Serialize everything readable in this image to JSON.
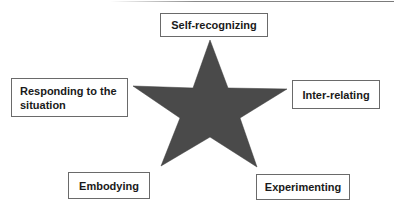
{
  "diagram": {
    "type": "star-with-labels",
    "center_shape": {
      "shape": "five-point-star",
      "fill_color": "#4a4a4a",
      "points": [
        [
          210,
          40
        ],
        [
          228,
          88
        ],
        [
          287,
          89
        ],
        [
          240,
          118
        ],
        [
          257,
          167
        ],
        [
          210,
          137
        ],
        [
          161,
          166
        ],
        [
          180,
          118
        ],
        [
          133,
          86
        ],
        [
          193,
          88
        ]
      ]
    },
    "labels": {
      "top": "Self-recognizing",
      "left": "Responding to the\nsituation",
      "right": "Inter-relating",
      "bottom_left": "Embodying",
      "bottom_right": "Experimenting"
    },
    "border_color": "#6a6a6a",
    "text_color": "#1a1a1a"
  }
}
